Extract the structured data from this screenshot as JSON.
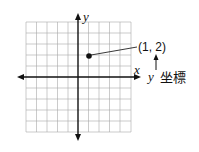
{
  "diagram": {
    "type": "coordinate-plane",
    "x_axis_label": "x",
    "y_axis_label": "y",
    "grid": {
      "cells_x": 10,
      "cells_y": 10,
      "color": "#9a9a9a"
    },
    "point": {
      "x": 1,
      "y": 2,
      "label": "(1, 2)"
    },
    "annotation": {
      "prefix": "y",
      "text": "坐標"
    }
  }
}
